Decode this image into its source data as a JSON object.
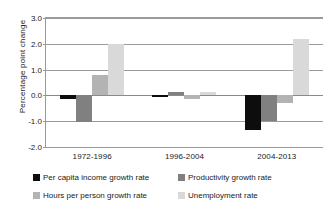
{
  "chart_data": {
    "type": "bar",
    "title": "",
    "xlabel": "",
    "ylabel": "Percentage point change",
    "ylim": [
      -2.0,
      3.0
    ],
    "ytick_labels": [
      "3.0",
      "2.0",
      "1.0",
      "0.0",
      "-1.0",
      "-2.0"
    ],
    "ytick_values": [
      3.0,
      2.0,
      1.0,
      0.0,
      -1.0,
      -2.0
    ],
    "grid": true,
    "legend_position": "bottom",
    "categories": [
      "1972-1996",
      "1996-2004",
      "2004-2013"
    ],
    "series": [
      {
        "name": "Per capita income growth rate",
        "color": "#0d0d0d",
        "values": [
          -0.15,
          -0.05,
          -1.35
        ]
      },
      {
        "name": "Productivity growth rate",
        "color": "#808080",
        "values": [
          -1.02,
          0.15,
          -1.0
        ]
      },
      {
        "name": "Hours per person growth rate",
        "color": "#b3b3b3",
        "values": [
          0.8,
          -0.15,
          -0.3
        ]
      },
      {
        "name": "Unemployment rate",
        "color": "#d9d9d9",
        "values": [
          2.0,
          0.15,
          2.2
        ]
      }
    ]
  }
}
